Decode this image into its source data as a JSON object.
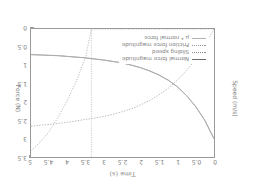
{
  "chart_data": {
    "type": "line",
    "title": "",
    "xlabel": "Time (s)",
    "ylabel_left": "Speed (m/s)",
    "ylabel_right": "Force (N)",
    "xlim": [
      0,
      5
    ],
    "ylim_right": [
      0,
      3.5
    ],
    "grid": false,
    "legend_position": "lower right",
    "xticks": [
      "0",
      "0.5",
      "1",
      "1.5",
      "2",
      "2.5",
      "3",
      "3.5",
      "4",
      "4.5",
      "5"
    ],
    "xtick_values": [
      0,
      0.5,
      1,
      1.5,
      2,
      2.5,
      3,
      3.5,
      4,
      4.5,
      5
    ],
    "yticks_right": [
      "0",
      "0.5",
      "1",
      "1.5",
      "2",
      "2.5",
      "3",
      "3.5"
    ],
    "ytick_values_right": [
      0,
      0.5,
      1,
      1.5,
      2,
      2.5,
      3,
      3.5
    ],
    "annotations": [
      {
        "name": "transition-line",
        "type": "vertical-dotted",
        "x": 3.35
      }
    ],
    "x": [
      0,
      0.25,
      0.5,
      0.75,
      1,
      1.25,
      1.5,
      1.75,
      2,
      2.25,
      2.5,
      2.75,
      3,
      3.35,
      3.5,
      3.75,
      4,
      4.25,
      4.5,
      4.75,
      5
    ],
    "series": [
      {
        "name": "Normal force magnitude",
        "style": "solid",
        "color": "#6e6e6e",
        "axis": "right",
        "values": [
          3.0,
          2.5,
          2.12,
          1.82,
          1.58,
          1.4,
          1.26,
          1.15,
          1.06,
          0.99,
          0.93,
          0.89,
          0.85,
          0.81,
          0.79,
          0.77,
          0.75,
          0.73,
          0.72,
          0.71,
          0.7
        ]
      },
      {
        "name": "Sliding speed",
        "style": "dotted",
        "color": "#8a8a8a",
        "axis": "left",
        "values": [
          0.0,
          0.0,
          0.0,
          0.0,
          0.0,
          0.0,
          0.0,
          0.0,
          0.0,
          0.0,
          0.0,
          0.0,
          0.0,
          0.0,
          0.55,
          1.05,
          1.45,
          1.8,
          2.1,
          2.32,
          2.5
        ]
      },
      {
        "name": "Friction force magnitude",
        "style": "dashed",
        "color": "#9a9a9a",
        "axis": "right",
        "values": [
          0.0,
          0.44,
          0.82,
          1.14,
          1.4,
          1.62,
          1.8,
          1.95,
          2.07,
          2.18,
          2.26,
          2.33,
          2.39,
          2.45,
          2.47,
          2.51,
          2.55,
          2.58,
          2.61,
          2.63,
          2.66
        ]
      },
      {
        "name": "μ * normal force",
        "style": "solid-light",
        "color": "#b0b0b0",
        "axis": "right",
        "values": [
          3.0,
          2.5,
          2.12,
          1.82,
          1.58,
          1.4,
          1.26,
          1.15,
          1.06,
          0.99,
          0.93,
          0.89,
          0.85,
          0.81,
          0.79,
          0.77,
          0.75,
          0.73,
          0.72,
          0.71,
          0.7
        ]
      }
    ]
  },
  "axes": {
    "x_title": "Time (s)",
    "y_left_title": "Speed (m/s)",
    "y_right_title": "Force (N)"
  },
  "legend": {
    "items": [
      {
        "label": "Normal force magnitude"
      },
      {
        "label": "Sliding speed"
      },
      {
        "label": "Friction force magnitude"
      },
      {
        "label": "μ * normal force"
      }
    ]
  },
  "colors": {
    "frame": "#9a9a9a",
    "text": "#7d7d7d",
    "background": "#ffffff"
  }
}
